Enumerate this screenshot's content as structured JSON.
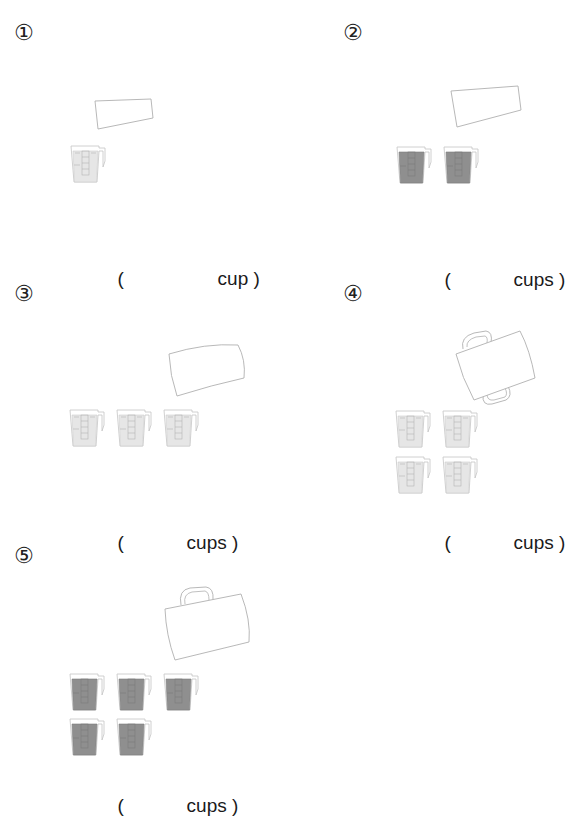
{
  "problems": [
    {
      "number": "①",
      "pitcher": "small-cup",
      "measuring_cups": 1,
      "fill": "light",
      "answer": {
        "open": "(",
        "blank": "",
        "unit": "cup",
        "close": ")"
      }
    },
    {
      "number": "②",
      "pitcher": "small-cup",
      "measuring_cups": 2,
      "fill": "dark",
      "answer": {
        "open": "(",
        "blank": "",
        "unit": "cups",
        "close": ")"
      }
    },
    {
      "number": "③",
      "pitcher": "bowl",
      "measuring_cups": 3,
      "fill": "light",
      "answer": {
        "open": "(",
        "blank": "",
        "unit": "cups",
        "close": ")"
      }
    },
    {
      "number": "④",
      "pitcher": "pot-two-handles",
      "measuring_cups": 4,
      "fill": "light",
      "answer": {
        "open": "(",
        "blank": "",
        "unit": "cups",
        "close": ")"
      }
    },
    {
      "number": "⑤",
      "pitcher": "bucket-with-handle",
      "measuring_cups": 5,
      "fill": "dark",
      "answer": {
        "open": "(",
        "blank": "",
        "unit": "cups",
        "close": ")"
      }
    }
  ],
  "colors": {
    "outline": "#b8b8b8",
    "fill_light": "#e6e6e6",
    "fill_dark": "#8f8f8f",
    "text": "#1a1a1a"
  }
}
